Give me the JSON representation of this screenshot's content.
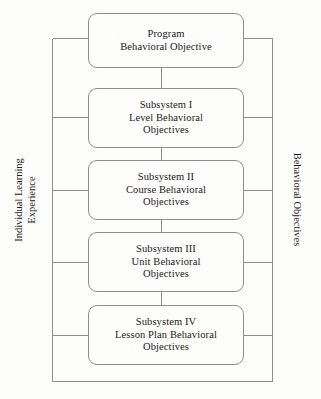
{
  "diagram": {
    "background_color": "#fdfdfb",
    "line_color": "#8e8e8e",
    "text_color": "#1a1a1a",
    "nodes": [
      {
        "id": "program",
        "line1": "Program",
        "line2": "Behavioral Objective",
        "line3": ""
      },
      {
        "id": "subsystem-1",
        "line1": "Subsystem I",
        "line2": "Level Behavioral",
        "line3": "Objectives"
      },
      {
        "id": "subsystem-2",
        "line1": "Subsystem II",
        "line2": "Course Behavioral",
        "line3": "Objectives"
      },
      {
        "id": "subsystem-3",
        "line1": "Subsystem III",
        "line2": "Unit Behavioral",
        "line3": "Objectives"
      },
      {
        "id": "subsystem-4",
        "line1": "Subsystem IV",
        "line2": "Lesson Plan Behavioral",
        "line3": "Objectives"
      }
    ],
    "left_label": {
      "line1": "Individual Learning",
      "line2": "Experience",
      "rotation": "bottom-to-top"
    },
    "right_label": {
      "line1": "Behavioral Objectives",
      "rotation": "top-to-bottom"
    }
  }
}
